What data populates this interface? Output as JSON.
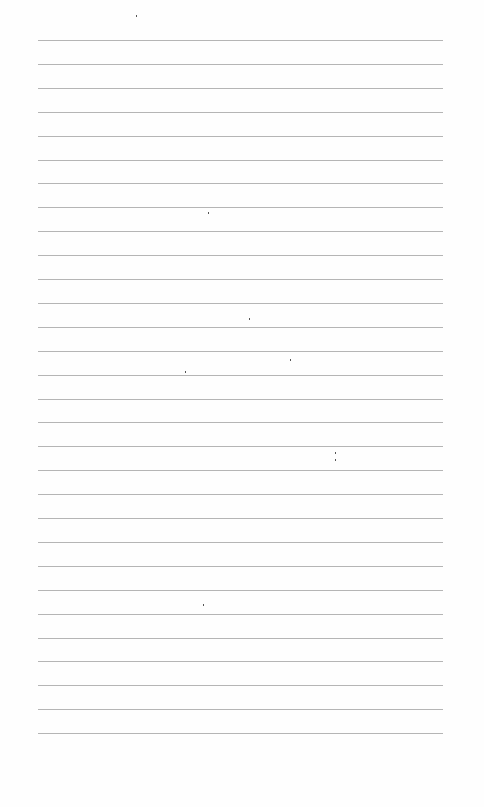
{
  "page": {
    "type": "blank-ruled-paper",
    "line_count": 30,
    "first_line_y": 40,
    "line_spacing": 23.9,
    "line_left": 38,
    "line_right": 443,
    "line_color": "#a8a8a8",
    "background_color": "#fefefe"
  }
}
